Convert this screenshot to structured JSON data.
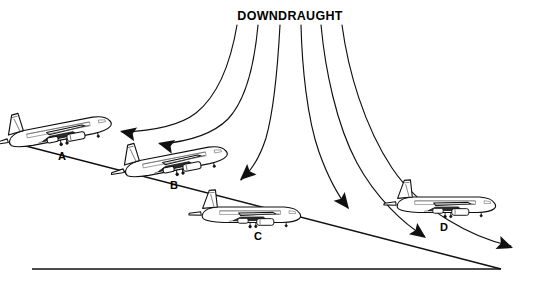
{
  "figure": {
    "title": "DOWNDRAUGHT",
    "domain_note": "aviation microburst / windshear approach diagram",
    "canvas": {
      "width": 533,
      "height": 282
    },
    "background_color": "#ffffff",
    "line_color": "#101010"
  },
  "aircraft": [
    {
      "id": "A",
      "label": "A",
      "x": 61,
      "y": 133,
      "scale": 1.0,
      "rotation": -11,
      "label_x": 62,
      "label_y": 160
    },
    {
      "id": "B",
      "label": "B",
      "x": 177,
      "y": 163,
      "scale": 1.0,
      "rotation": -11,
      "label_x": 174,
      "label_y": 189
    },
    {
      "id": "C",
      "label": "C",
      "x": 252,
      "y": 216,
      "scale": 0.95,
      "rotation": 0,
      "label_x": 258,
      "label_y": 240
    },
    {
      "id": "D",
      "label": "D",
      "x": 447,
      "y": 206,
      "scale": 0.95,
      "rotation": 0,
      "label_x": 444,
      "label_y": 231
    }
  ],
  "downdraught_curves": [
    {
      "id": "curve-1",
      "start_x": 237,
      "start_y": 25,
      "end_x": 120,
      "end_y": 131,
      "arrow_angle": 210
    },
    {
      "id": "curve-2",
      "start_x": 258,
      "start_y": 25,
      "end_x": 157,
      "end_y": 142,
      "arrow_angle": 215
    },
    {
      "id": "curve-3",
      "start_x": 280,
      "start_y": 25,
      "end_x": 239,
      "end_y": 179,
      "arrow_angle": 250
    },
    {
      "id": "curve-4",
      "start_x": 301,
      "start_y": 25,
      "end_x": 350,
      "end_y": 209,
      "arrow_angle": 290
    },
    {
      "id": "curve-5",
      "start_x": 321,
      "start_y": 25,
      "end_x": 427,
      "end_y": 237,
      "arrow_angle": 295
    },
    {
      "id": "curve-6",
      "start_x": 342,
      "start_y": 25,
      "end_x": 515,
      "end_y": 247,
      "arrow_angle": 318
    }
  ],
  "ground": {
    "x1": 32,
    "y1": 269,
    "x2": 501,
    "y2": 269
  },
  "glide_path": {
    "x1": 18,
    "y1": 144,
    "x2": 501,
    "y2": 269
  },
  "labels": {
    "title_x": 290,
    "title_y": 20
  }
}
